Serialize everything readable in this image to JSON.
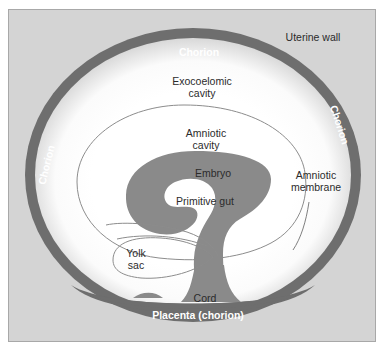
{
  "figure": {
    "type": "anatomical-diagram",
    "colors": {
      "panel_background": "#d4d4d4",
      "panel_border": "#a8a8a8",
      "chorion_ring": "#6e6e6e",
      "embryo_tissue": "#8a8a8a",
      "cavity_fill": "#ffffff",
      "membrane_outline": "#8c8c8c",
      "dark_text": "#2b2b2b",
      "white_text": "#ffffff"
    }
  },
  "labels": {
    "uterine_wall": "Uterine wall",
    "chorion_top": "Chorion",
    "chorion_right": "Chorion",
    "chorion_left": "Chorion",
    "exocoelomic_cavity": "Exocoelomic\ncavity",
    "amniotic_cavity": "Amniotic\ncavity",
    "embryo": "Embryo",
    "primitive_gut": "Primitive gut",
    "amniotic_membrane": "Amniotic\nmembrane",
    "yolk_sac": "Yolk\nsac",
    "cord": "Cord",
    "placenta": "Placenta (chorion)"
  },
  "structures": [
    {
      "name": "uterine-wall",
      "label": "Uterine wall",
      "text_color": "dark",
      "region": "background panel"
    },
    {
      "name": "chorion-ring",
      "label": "Chorion",
      "text_color": "white",
      "region": "outer dark ellipse ring"
    },
    {
      "name": "exocoelomic-cavity",
      "label": "Exocoelomic cavity",
      "text_color": "dark",
      "region": "white space between chorion and amnion"
    },
    {
      "name": "amniotic-cavity",
      "label": "Amniotic cavity",
      "text_color": "dark",
      "region": "inside amniotic membrane"
    },
    {
      "name": "amniotic-membrane",
      "label": "Amniotic membrane",
      "text_color": "dark",
      "region": "thin outlined oval with leader line"
    },
    {
      "name": "embryo",
      "label": "Embryo",
      "text_color": "dark",
      "region": "curled grey mass at center"
    },
    {
      "name": "primitive-gut",
      "label": "Primitive gut",
      "text_color": "dark",
      "region": "white cavity inside embryo"
    },
    {
      "name": "yolk-sac",
      "label": "Yolk sac",
      "text_color": "dark",
      "region": "elongated oval lower left"
    },
    {
      "name": "cord",
      "label": "Cord",
      "text_color": "dark",
      "region": "stalk joining embryo to placenta"
    },
    {
      "name": "placenta",
      "label": "Placenta (chorion)",
      "text_color": "white",
      "region": "thickened dark band at bottom of ring"
    }
  ]
}
